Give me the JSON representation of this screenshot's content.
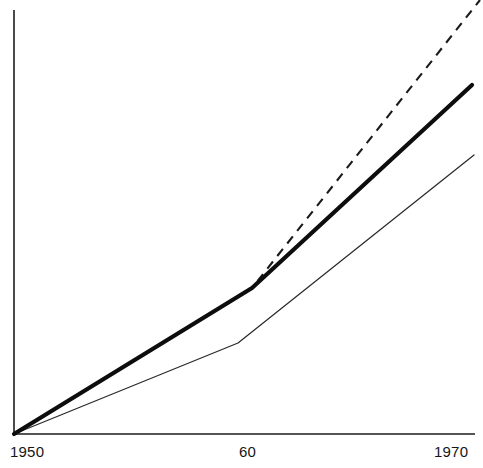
{
  "chart_data": {
    "type": "line",
    "title": "",
    "subtitle": "",
    "xlabel": "",
    "ylabel": "",
    "xlim": [
      1950,
      1970
    ],
    "ylim": [
      0,
      100
    ],
    "grid": false,
    "legend": "none",
    "x_tick_labels": [
      "1950",
      "60",
      "1970"
    ],
    "x_tick_values": [
      1950,
      1960,
      1970
    ],
    "y_tick_labels": [],
    "y_tick_values": [],
    "annotations": [],
    "series": [
      {
        "name": "thick-solid",
        "style": "solid",
        "width": "thick",
        "color": "#0d0d0d",
        "x": [
          1950,
          1960,
          1970
        ],
        "values": [
          0,
          34.5,
          82.5
        ]
      },
      {
        "name": "dashed",
        "style": "dashed",
        "width": "medium",
        "color": "#1a1a1a",
        "x": [
          1950,
          1960,
          1970
        ],
        "values": [
          0,
          34.5,
          102.0
        ]
      },
      {
        "name": "thin-solid",
        "style": "solid",
        "width": "thin",
        "color": "#2a2a2a",
        "x": [
          1950,
          1959,
          1970
        ],
        "values": [
          0,
          21.5,
          66.0
        ]
      }
    ]
  },
  "axes": {
    "x_axis_name": "x-axis",
    "y_axis_name": "y-axis",
    "origin_label": "1950",
    "mid_label": "60",
    "end_label": "1970"
  },
  "geometry": {
    "x0": 14,
    "y0": 434,
    "x_end": 475,
    "y_top": 10,
    "thick_path": "M 14 434 L 252 288 L 472 85",
    "dashed_path": "M 14 434 L 252 288 L 480 0",
    "thin_path": "M 14 434 L 238 343 L 474 155",
    "x_axis_path": "M 14 434 L 475 434",
    "y_axis_path": "M 14 10 L 14 434"
  },
  "colors": {
    "background": "#ffffff",
    "axis": "#1d1d1d",
    "thick_series": "#0d0d0d",
    "dashed_series": "#1a1a1a",
    "thin_series": "#2a2a2a",
    "tick_text": "#161616"
  }
}
